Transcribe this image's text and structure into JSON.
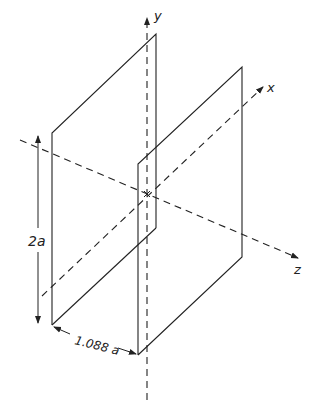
{
  "figure": {
    "axes": {
      "y_label": "y",
      "x_label": "x",
      "z_label": "z"
    },
    "dimensions": {
      "height_label": "2a",
      "separation_label": "1.088 a"
    },
    "colors": {
      "line": "#222222",
      "background": "#ffffff"
    }
  }
}
